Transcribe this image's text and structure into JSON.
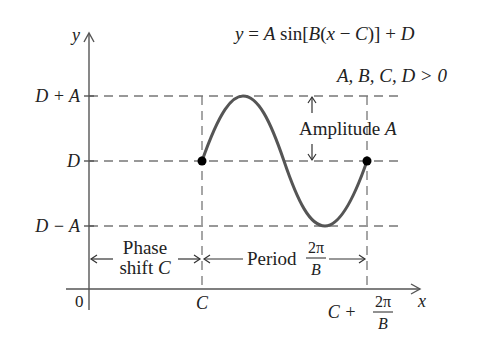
{
  "diagram": {
    "equation": "y = A sin[B(x − C)] + D",
    "equation_parts": {
      "y": "y",
      "eq": " = ",
      "A": "A",
      "sin": " sin[",
      "B": "B",
      "open": "(",
      "x": "x",
      "minus": " − ",
      "C": "C",
      "close": ")] + ",
      "D": "D"
    },
    "condition": "A, B, C, D > 0",
    "axes": {
      "y_label": "y",
      "x_label": "x",
      "origin_label": "0"
    },
    "y_ticks": [
      {
        "label": "D + A",
        "level": "max"
      },
      {
        "label": "D",
        "level": "midline"
      },
      {
        "label": "D − A",
        "level": "min"
      }
    ],
    "x_ticks": {
      "start": "C",
      "end_prefix": "C + ",
      "end_frac_num": "2π",
      "end_frac_den": "B"
    },
    "annotations": {
      "amplitude": "Amplitude A",
      "amplitude_text": "Amplitude ",
      "amplitude_var": "A",
      "phase_line1": "Phase",
      "phase_line2": "shift ",
      "phase_var": "C",
      "period_text": "Period ",
      "period_frac_num": "2π",
      "period_frac_den": "B"
    },
    "colors": {
      "curve": "#555555",
      "axes": "#555555",
      "dashes": "#777777",
      "points": "#000000",
      "text": "#222222"
    }
  }
}
